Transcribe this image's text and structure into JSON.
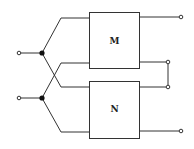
{
  "diagram": {
    "type": "circuit-block-diagram",
    "blocks": [
      {
        "id": "M",
        "label": "M"
      },
      {
        "id": "N",
        "label": "N"
      }
    ],
    "inputs": [
      "input-top",
      "input-bottom"
    ],
    "outputs": [
      "output-M-top",
      "output-M-bottom",
      "output-N-top",
      "output-N-bottom"
    ],
    "connections": "Inputs split at junctions and cross-connect to both blocks; M bottom and N top outputs are shorted together"
  },
  "colors": {
    "line": "#333333",
    "junction": "#111111",
    "background": "#ffffff"
  }
}
